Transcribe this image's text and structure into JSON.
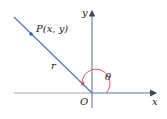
{
  "diagram": {
    "labels": {
      "point": "P(x, y)",
      "radius": "r",
      "angle": "θ",
      "origin": "O",
      "x_axis": "x",
      "y_axis": "y"
    },
    "colors": {
      "ray": "#4a78c4",
      "axis": "#6b7a8c",
      "negative_axis": "#a7a7a7",
      "arc": "#d9536b",
      "point": "#2f5fb0"
    }
  }
}
